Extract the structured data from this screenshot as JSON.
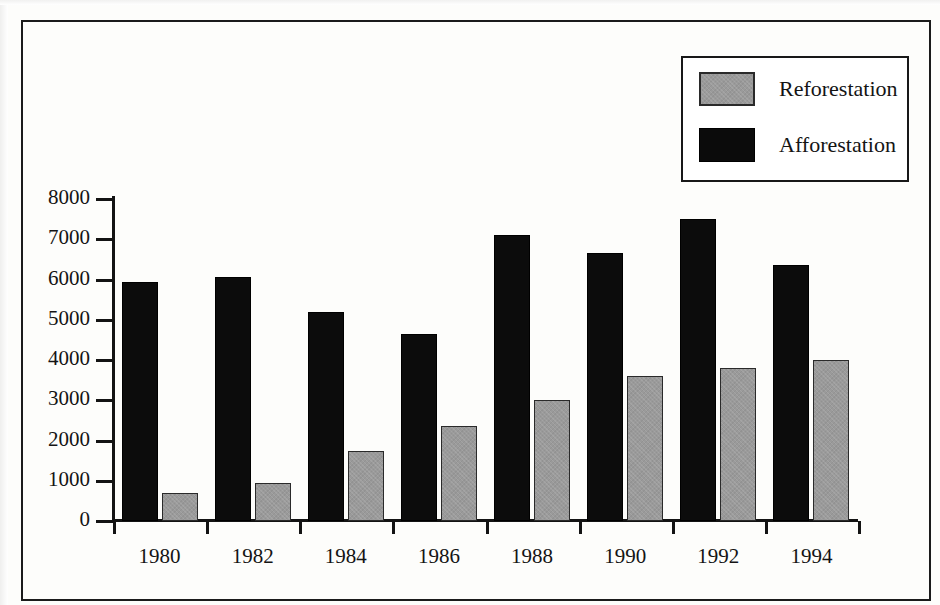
{
  "chart_data": {
    "type": "bar",
    "title": "",
    "xlabel": "",
    "ylabel": "",
    "categories": [
      "1980",
      "1982",
      "1984",
      "1986",
      "1988",
      "1990",
      "1992",
      "1994"
    ],
    "series": [
      {
        "name": "Afforestation",
        "color": "#0c0c0c",
        "values": [
          5950,
          6050,
          5200,
          4650,
          7100,
          6650,
          7500,
          6350
        ]
      },
      {
        "name": "Reforestation",
        "color": "#9a9a9a",
        "values": [
          700,
          950,
          1750,
          2350,
          3000,
          3600,
          3800,
          4000
        ]
      }
    ],
    "ylim": [
      0,
      8000
    ],
    "y_ticks": [
      "0",
      "1000",
      "2000",
      "3000",
      "4000",
      "5000",
      "6000",
      "7000",
      "8000"
    ],
    "grid": false,
    "legend_position": "top-right"
  },
  "legend": {
    "entries": [
      {
        "label": "Reforestation",
        "swatch": "gray"
      },
      {
        "label": "Afforestation",
        "swatch": "black"
      }
    ]
  },
  "axes": {
    "y_tick_labels": [
      "8000",
      "7000",
      "6000",
      "5000",
      "4000",
      "3000",
      "2000",
      "1000",
      "0"
    ],
    "x_tick_labels": [
      "1980",
      "1982",
      "1984",
      "1986",
      "1988",
      "1990",
      "1992",
      "1994"
    ]
  }
}
